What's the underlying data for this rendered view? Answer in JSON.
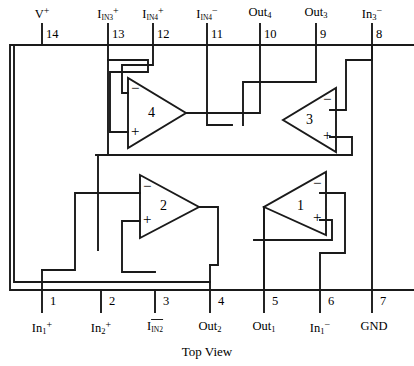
{
  "diagram": {
    "caption": "Top View",
    "package": {
      "pin_count": 14,
      "outline_color": "#1a1a1a"
    },
    "top_pins": [
      {
        "number": "14",
        "base": "V",
        "sup": "+",
        "sub": ""
      },
      {
        "number": "13",
        "base": "I",
        "sub": "IN3",
        "sup": "+"
      },
      {
        "number": "12",
        "base": "I",
        "sub": "IN4",
        "sup": "+"
      },
      {
        "number": "11",
        "base": "I",
        "sub": "IN4",
        "sup": "−"
      },
      {
        "number": "10",
        "base": "Out",
        "sub": "4",
        "sup": ""
      },
      {
        "number": "9",
        "base": "Out",
        "sub": "3",
        "sup": ""
      },
      {
        "number": "8",
        "base": "In",
        "sub": "3",
        "sup": "−"
      }
    ],
    "bottom_pins": [
      {
        "number": "1",
        "base": "In",
        "sub": "1",
        "sup": "+"
      },
      {
        "number": "2",
        "base": "In",
        "sub": "2",
        "sup": "+"
      },
      {
        "number": "3",
        "base": "I",
        "sub": "IN2",
        "sup": "−",
        "barred": true
      },
      {
        "number": "4",
        "base": "Out",
        "sub": "2",
        "sup": ""
      },
      {
        "number": "5",
        "base": "Out",
        "sub": "1",
        "sup": ""
      },
      {
        "number": "6",
        "base": "In",
        "sub": "1",
        "sup": "−"
      },
      {
        "number": "7",
        "base": "GND",
        "sub": "",
        "sup": ""
      }
    ],
    "amplifiers": [
      {
        "id": "4",
        "label": "4",
        "orientation": "right",
        "minus": "−",
        "plus": "+"
      },
      {
        "id": "3",
        "label": "3",
        "orientation": "left",
        "minus": "−",
        "plus": "+"
      },
      {
        "id": "2",
        "label": "2",
        "orientation": "right",
        "minus": "−",
        "plus": "+"
      },
      {
        "id": "1",
        "label": "1",
        "orientation": "left",
        "minus": "−",
        "plus": "+"
      }
    ]
  }
}
